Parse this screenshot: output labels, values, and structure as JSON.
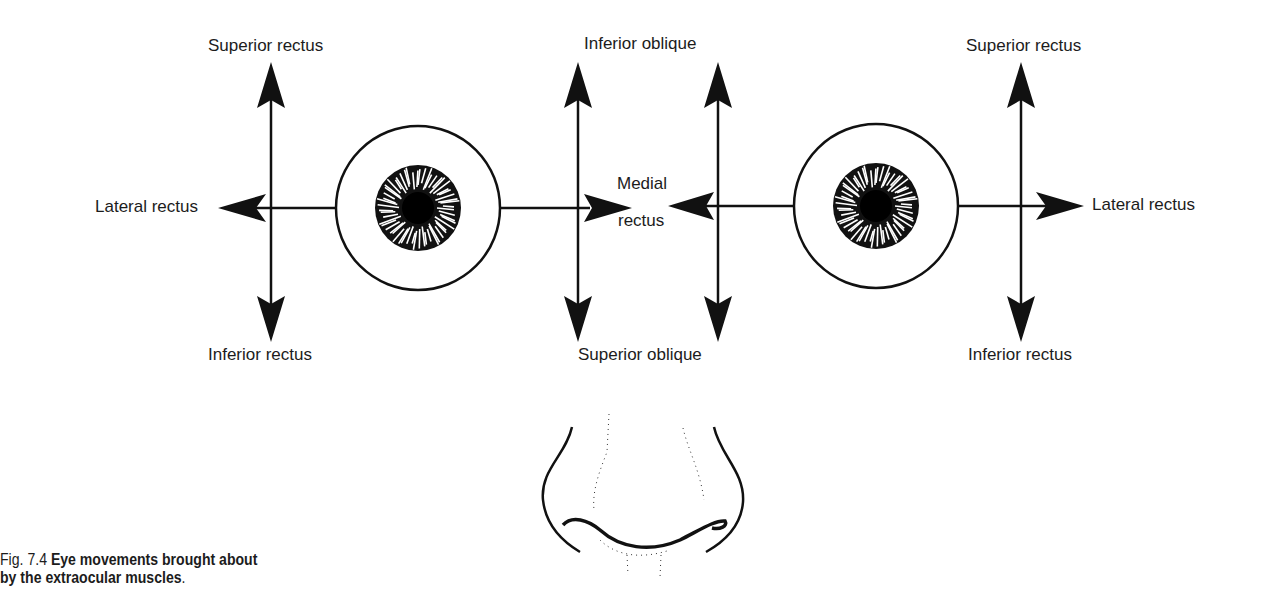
{
  "figure": {
    "caption_number": "Fig. 7.4",
    "caption_text": "Eye movements brought about",
    "caption_text_line2": "by the extraocular muscles",
    "caption_end": "."
  },
  "left_eye": {
    "superior": "Superior rectus",
    "inferior": "Inferior rectus",
    "lateral": "Lateral rectus"
  },
  "center": {
    "top": "Inferior oblique",
    "bottom": "Superior oblique",
    "medial_line1": "Medial",
    "medial_line2": "rectus"
  },
  "right_eye": {
    "superior": "Superior rectus",
    "inferior": "Inferior rectus",
    "lateral": "Lateral rectus"
  }
}
